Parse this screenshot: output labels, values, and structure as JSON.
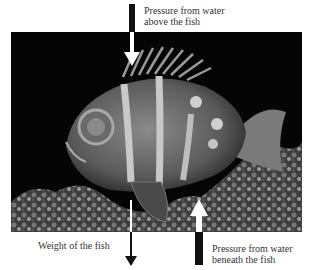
{
  "diagram": {
    "labels": {
      "top": [
        "Pressure from water",
        "above the fish"
      ],
      "weight": "Weight of the fish",
      "bottom": [
        "Pressure from water",
        "beneath the fish"
      ]
    },
    "arrows": [
      {
        "name": "pressure-above",
        "direction": "down",
        "color": "#ffffff"
      },
      {
        "name": "weight",
        "direction": "down",
        "color": "#1a1a1a"
      },
      {
        "name": "pressure-below",
        "direction": "up",
        "color": "#ffffff"
      }
    ],
    "colors": {
      "background": "#ffffff",
      "photo_bg": "#050505",
      "text": "#333333"
    }
  }
}
